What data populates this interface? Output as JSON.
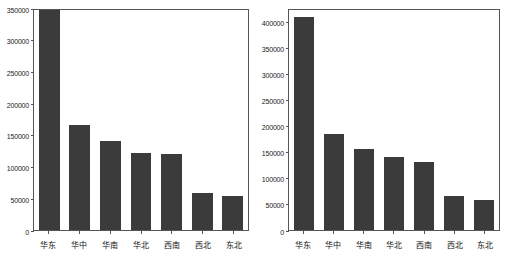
{
  "figure": {
    "background_color": "#ffffff",
    "bar_color": "#3b3b3b",
    "axis_color": "#555555",
    "panel_count": 2
  },
  "chart_data": [
    {
      "type": "bar",
      "title": "",
      "xlabel": "",
      "ylabel": "",
      "categories": [
        "华东",
        "华中",
        "华南",
        "华北",
        "西南",
        "西北",
        "东北"
      ],
      "values": [
        350000,
        166000,
        140000,
        122000,
        120000,
        58000,
        53000
      ],
      "ylim": [
        0,
        350000
      ],
      "yticks": [
        0,
        50000,
        100000,
        150000,
        200000,
        250000,
        300000,
        350000
      ],
      "ytick_labels": [
        "0",
        "50000",
        "100000",
        "150000",
        "200000",
        "250000",
        "300000",
        "350000"
      ],
      "grid": false,
      "legend": null,
      "notes": "first bar reaches the top of the axis and is clipped"
    },
    {
      "type": "bar",
      "title": "",
      "xlabel": "",
      "ylabel": "",
      "categories": [
        "华东",
        "华中",
        "华南",
        "华北",
        "西南",
        "西北",
        "东北"
      ],
      "values": [
        408000,
        184000,
        156000,
        139000,
        130000,
        65000,
        57000
      ],
      "ylim": [
        0,
        425000
      ],
      "yticks": [
        0,
        50000,
        100000,
        150000,
        200000,
        250000,
        300000,
        350000,
        400000
      ],
      "ytick_labels": [
        "0",
        "50000",
        "100000",
        "150000",
        "200000",
        "250000",
        "300000",
        "350000",
        "400000"
      ],
      "grid": false,
      "legend": null,
      "notes": "first bar exceeds the 400000 tick slightly"
    }
  ]
}
